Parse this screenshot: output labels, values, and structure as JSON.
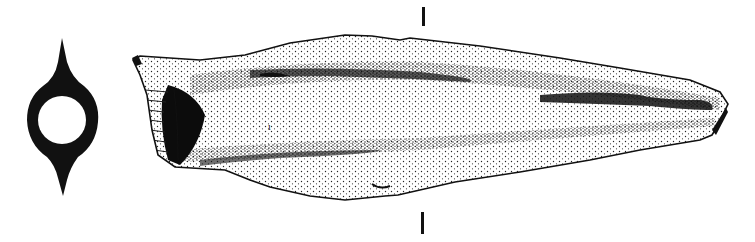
{
  "figure": {
    "background_color": "#ffffff",
    "ink_color": "#111111",
    "cross_section": {
      "center": [
        62,
        118
      ],
      "outer_radius_x": 34,
      "outer_radius_y": 38,
      "inner_radius": 24
    },
    "section_marks": [
      {
        "x": 423,
        "y1": 7,
        "y2": 26
      },
      {
        "x": 422,
        "y1": 212,
        "y2": 234
      }
    ]
  }
}
